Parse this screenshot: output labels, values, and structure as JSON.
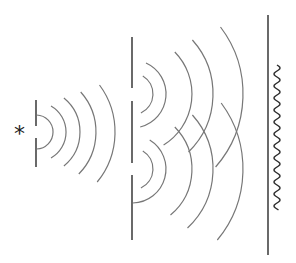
{
  "diagram": {
    "source": {
      "symbol": "*",
      "x": 22,
      "y": 132
    },
    "colors": {
      "background": "#ffffff",
      "barrier": "#444444",
      "wavefront": "#777777",
      "pattern": "#333333"
    },
    "barrier1": {
      "x": 36,
      "segments": [
        [
          100,
          126
        ],
        [
          138,
          167
        ]
      ],
      "slit_y": 132
    },
    "barrier2": {
      "x": 132,
      "segments": [
        [
          37,
          88
        ],
        [
          101,
          163
        ],
        [
          175,
          240
        ]
      ],
      "slits_y": [
        94,
        169
      ]
    },
    "screen": {
      "x": 268,
      "y1": 15,
      "y2": 255
    },
    "pattern": {
      "x": 277,
      "y1": 65,
      "y2": 210,
      "period": 12,
      "amplitude": 3
    },
    "wavefronts_source": {
      "cx": 36,
      "cy": 132,
      "arcs": [
        {
          "r": 17,
          "y1": 113,
          "y2": 151
        },
        {
          "r": 30,
          "y1": 106,
          "y2": 158
        },
        {
          "r": 44,
          "y1": 98,
          "y2": 166
        },
        {
          "r": 60,
          "y1": 92,
          "y2": 174
        },
        {
          "r": 79,
          "y1": 85,
          "y2": 182
        }
      ]
    },
    "wavefronts_upper_slit": {
      "cx": 132,
      "cy": 94,
      "arcs": [
        {
          "r": 21,
          "y1": 76,
          "y2": 113
        },
        {
          "r": 34,
          "y1": 63,
          "y2": 127
        },
        {
          "r": 60,
          "y1": 52,
          "y2": 145
        },
        {
          "r": 81,
          "y1": 40,
          "y2": 152
        },
        {
          "r": 111,
          "y1": 27,
          "y2": 167
        }
      ]
    },
    "wavefronts_lower_slit": {
      "cx": 132,
      "cy": 169,
      "arcs": [
        {
          "r": 21,
          "y1": 151,
          "y2": 188
        },
        {
          "r": 34,
          "y1": 140,
          "y2": 203
        },
        {
          "r": 60,
          "y1": 127,
          "y2": 215
        },
        {
          "r": 81,
          "y1": 115,
          "y2": 228
        },
        {
          "r": 111,
          "y1": 103,
          "y2": 240
        }
      ]
    }
  }
}
